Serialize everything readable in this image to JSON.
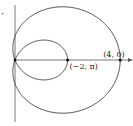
{
  "figure": {
    "curve": {
      "equation": "r = 1 + 3cos(theta)",
      "a": 1,
      "b": 3
    },
    "origin_px": [
      15,
      60
    ],
    "scale_x": 26.3,
    "scale_y": 23.7,
    "colors": {
      "curve": "#333333",
      "axis": "#555555",
      "point": "#111111"
    },
    "points": [
      {
        "label": "(4, 0)",
        "x": 4,
        "y": 0,
        "label_dx": -17,
        "label_dy": -3
      },
      {
        "label": "(−2, π)",
        "x": 2,
        "y": 0,
        "label_dx": 2,
        "label_dy": 9
      }
    ],
    "marker": "·"
  }
}
